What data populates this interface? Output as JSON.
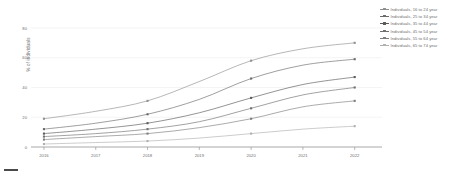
{
  "chart_data": {
    "type": "line",
    "title": "",
    "xlabel": "",
    "ylabel": "% of individuals",
    "x": [
      2016,
      2017,
      2018,
      2019,
      2020,
      2021,
      2022
    ],
    "xtick_labels": [
      "2016",
      "2017",
      "2018",
      "2019",
      "2020",
      "2021",
      "2022"
    ],
    "ytick_labels": [
      "0",
      "20",
      "40",
      "60",
      "80"
    ],
    "yticks": [
      0,
      20,
      40,
      60,
      80
    ],
    "ylim": [
      0,
      84
    ],
    "xlim": [
      2015.75,
      2022.45
    ],
    "grid": true,
    "legend_position": "top-right",
    "series": [
      {
        "name": "Individuals, 16 to 24 year",
        "values": [
          19,
          24,
          31,
          44,
          58,
          66,
          70
        ]
      },
      {
        "name": "Individuals, 25 to 34 year",
        "values": [
          12,
          16,
          22,
          32,
          46,
          55,
          59
        ]
      },
      {
        "name": "Individuals, 35 to 44 year",
        "values": [
          9,
          12,
          16,
          23,
          33,
          42,
          47
        ]
      },
      {
        "name": "Individuals, 45 to 54 year",
        "values": [
          7,
          9,
          12,
          17,
          26,
          35,
          40
        ]
      },
      {
        "name": "Individuals, 55 to 64 year",
        "values": [
          5,
          7,
          9,
          13,
          19,
          27,
          31
        ]
      },
      {
        "name": "Individuals, 65 to 74 year",
        "values": [
          2,
          3,
          4,
          6,
          9,
          12,
          14
        ]
      }
    ],
    "series_colors": [
      "#8f8f8f",
      "#6a6a6a",
      "#5a5a5a",
      "#6f6f6f",
      "#7d7d7d",
      "#b0b0b0"
    ]
  },
  "legend": {
    "items": [
      {
        "label": "Individuals, 16 to 24 year"
      },
      {
        "label": "Individuals, 25 to 34 year"
      },
      {
        "label": "Individuals, 35 to 44 year"
      },
      {
        "label": "Individuals, 45 to 54 year"
      },
      {
        "label": "Individuals, 55 to 64 year"
      },
      {
        "label": "Individuals, 65 to 74 year"
      }
    ]
  },
  "caption": {
    "text": ""
  }
}
